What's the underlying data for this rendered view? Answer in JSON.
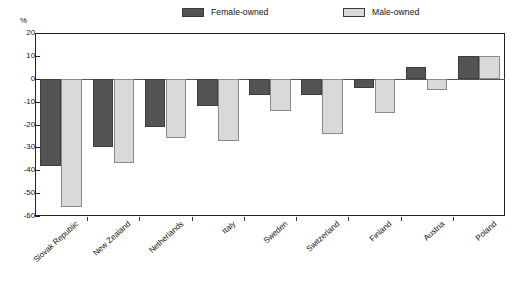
{
  "chart_data": {
    "type": "bar",
    "title": "",
    "subtitle": "",
    "xlabel": "",
    "ylabel": "",
    "unit_label": "%",
    "ylim": [
      -60,
      20
    ],
    "yticks": [
      20,
      10,
      0,
      -10,
      -20,
      -30,
      -40,
      -50,
      -60
    ],
    "ytick_labels": [
      "20",
      "10",
      "0",
      "-10",
      "-20",
      "-30",
      "-40",
      "-50",
      "-60"
    ],
    "grid": false,
    "legend_position": "top",
    "categories": [
      "Slovak Republic",
      "New Zealand",
      "Netherlands",
      "Italy",
      "Sweden",
      "Switzerland",
      "Finland",
      "Austria",
      "Poland"
    ],
    "series": [
      {
        "name": "Female-owned",
        "color": "#545454",
        "values": [
          -38,
          -30,
          -21,
          -12,
          -7,
          -7,
          -4,
          5,
          10
        ]
      },
      {
        "name": "Male-owned",
        "color": "#d9d9d9",
        "values": [
          -56,
          -37,
          -26,
          -27,
          -14,
          -24,
          -15,
          -5,
          10
        ]
      }
    ]
  },
  "legend": {
    "entries": [
      {
        "label": "Female-owned",
        "swatch": "#545454"
      },
      {
        "label": "Male-owned",
        "swatch": "#d9d9d9"
      }
    ]
  }
}
